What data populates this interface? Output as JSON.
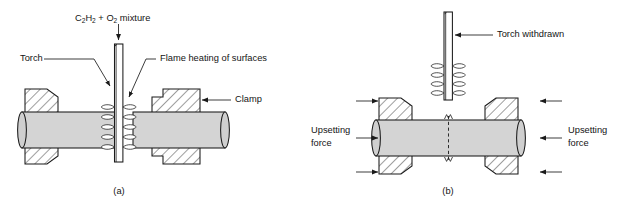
{
  "figure": {
    "colors": {
      "line": "#1a1a1a",
      "workpiece_fill": "#d4d4d4",
      "clamp_fill": "#ffffff",
      "background": "#ffffff"
    }
  },
  "panel_a": {
    "caption": "(a)",
    "labels": {
      "gas_mixture_prefix": "C",
      "gas_mixture_sub1": "2",
      "gas_mixture_mid": "H",
      "gas_mixture_sub2": "2",
      "gas_mixture_plus": " + O",
      "gas_mixture_sub3": "2",
      "gas_mixture_suffix": " mixture",
      "gas_mixture_full": "C2H2 + O2 mixture",
      "torch": "Torch",
      "flame_heating": "Flame heating of surfaces",
      "clamp": "Clamp"
    }
  },
  "panel_b": {
    "caption": "(b)",
    "labels": {
      "torch_withdrawn": "Torch withdrawn",
      "upsetting_force_left_line1": "Upsetting",
      "upsetting_force_left_line2": "force",
      "upsetting_force_right_line1": "Upsetting",
      "upsetting_force_right_line2": "force"
    }
  }
}
